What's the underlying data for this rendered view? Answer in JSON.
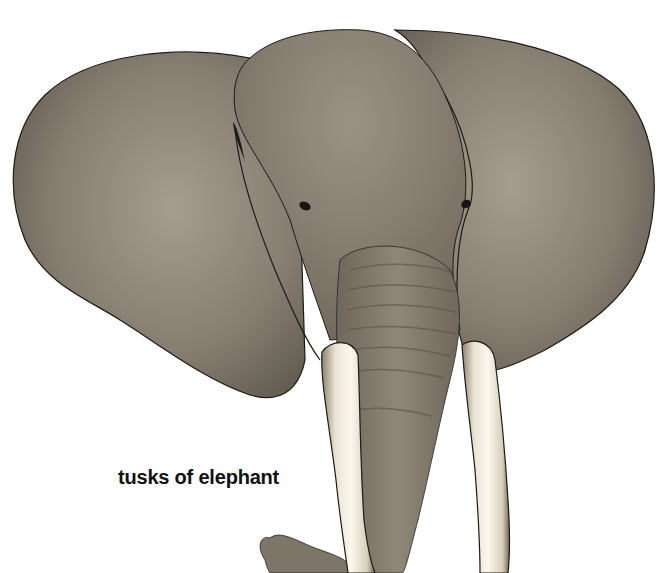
{
  "caption": "tusks of elephant",
  "colors": {
    "skin": "#8a8274",
    "skin_dark": "#5e574c",
    "skin_light": "#a79f90",
    "tusk": "#f2ede0",
    "tusk_shadow": "#b9ad94",
    "outline": "#1e1a16",
    "background": "#ffffff"
  }
}
